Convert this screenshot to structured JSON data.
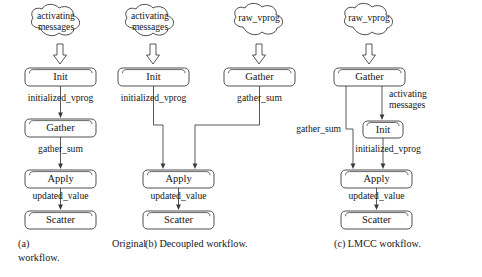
{
  "figure": {
    "panels": [
      {
        "id": "a",
        "caption_label": "(a)",
        "caption_word1": "Original",
        "caption_word2": "workflow.",
        "caption_full": "(a) Original workflow.",
        "sources": [
          {
            "name": "activating-messages-cloud",
            "line1": "activating",
            "line2": "messages"
          }
        ],
        "nodes": [
          {
            "name": "init-node",
            "label": "Init"
          },
          {
            "name": "gather-node",
            "label": "Gather"
          },
          {
            "name": "apply-node",
            "label": "Apply"
          },
          {
            "name": "scatter-node",
            "label": "Scatter"
          }
        ],
        "edge_labels": [
          {
            "name": "edge-label-initialized-vprog",
            "text": "initialized_vprog"
          },
          {
            "name": "edge-label-gather-sum",
            "text": "gather_sum"
          },
          {
            "name": "edge-label-updated-value",
            "text": "updated_value"
          }
        ]
      },
      {
        "id": "b",
        "caption_label": "(b)",
        "caption_word1": "Decoupled",
        "caption_word2": "workflow.",
        "caption_full": "(b) Decoupled workflow.",
        "sources": [
          {
            "name": "activating-messages-cloud",
            "line1": "activating",
            "line2": "messages"
          },
          {
            "name": "raw-vprog-cloud",
            "line1": "raw_vprog",
            "line2": ""
          }
        ],
        "nodes": [
          {
            "name": "init-node",
            "label": "Init"
          },
          {
            "name": "gather-node",
            "label": "Gather"
          },
          {
            "name": "apply-node",
            "label": "Apply"
          },
          {
            "name": "scatter-node",
            "label": "Scatter"
          }
        ],
        "edge_labels": [
          {
            "name": "edge-label-initialized-vprog",
            "text": "initialized_vprog"
          },
          {
            "name": "edge-label-gather-sum",
            "text": "gather_sum"
          },
          {
            "name": "edge-label-updated-value",
            "text": "updated_value"
          }
        ]
      },
      {
        "id": "c",
        "caption_label": "(c)",
        "caption_word1": "LMCC",
        "caption_word2": "workflow.",
        "caption_full": "(c) LMCC workflow.",
        "sources": [
          {
            "name": "raw-vprog-cloud",
            "line1": "raw_vprog",
            "line2": ""
          }
        ],
        "nodes": [
          {
            "name": "gather-node",
            "label": "Gather"
          },
          {
            "name": "init-node",
            "label": "Init"
          },
          {
            "name": "apply-node",
            "label": "Apply"
          },
          {
            "name": "scatter-node",
            "label": "Scatter"
          }
        ],
        "edge_labels": [
          {
            "name": "edge-label-activating-messages-1",
            "text": "activating"
          },
          {
            "name": "edge-label-activating-messages-2",
            "text": "messages"
          },
          {
            "name": "edge-label-gather-sum",
            "text": "gather_sum"
          },
          {
            "name": "edge-label-initialized-vprog",
            "text": "initialized_vprog"
          },
          {
            "name": "edge-label-updated-value",
            "text": "updated_value"
          }
        ]
      }
    ],
    "colors": {
      "stroke": "#3a3a3a",
      "text": "#151515",
      "background": "#ffffff"
    }
  }
}
